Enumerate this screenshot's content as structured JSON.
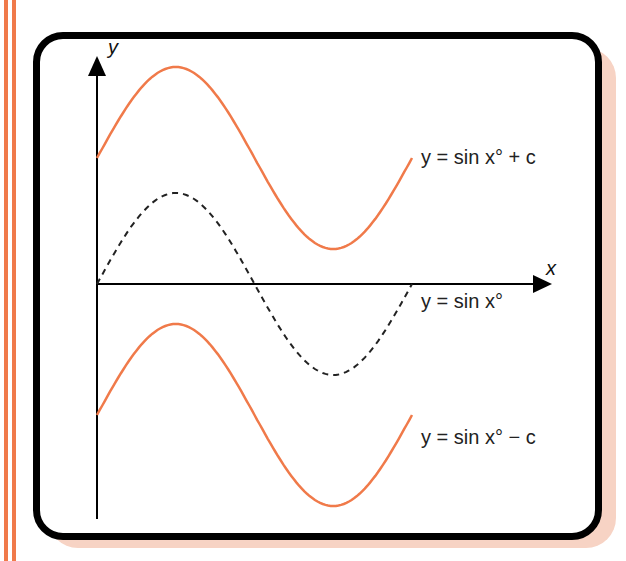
{
  "colors": {
    "accent_orange": "#f07a4a",
    "shadow_pink": "#f7d3c4",
    "border": "#000000",
    "dashed_curve": "#222222"
  },
  "axes": {
    "x_label": "x",
    "y_label": "y"
  },
  "labels": {
    "upper": "y = sin x° + c",
    "middle": "y = sin x°",
    "lower": "y = sin x° − c"
  },
  "chart_data": {
    "type": "line",
    "title": "",
    "xlabel": "x",
    "ylabel": "y",
    "x_range_degrees": [
      0,
      360
    ],
    "grid": false,
    "series": [
      {
        "name": "y = sin x° + c",
        "style": "solid",
        "color": "#f07a4a",
        "offset": "+c",
        "x": [
          0,
          90,
          180,
          270,
          360
        ],
        "y": [
          "c",
          "1+c",
          "c",
          "-1+c",
          "c"
        ]
      },
      {
        "name": "y = sin x°",
        "style": "dashed",
        "color": "#222222",
        "offset": "0",
        "x": [
          0,
          90,
          180,
          270,
          360
        ],
        "y": [
          0,
          1,
          0,
          -1,
          0
        ]
      },
      {
        "name": "y = sin x° − c",
        "style": "solid",
        "color": "#f07a4a",
        "offset": "-c",
        "x": [
          0,
          90,
          180,
          270,
          360
        ],
        "y": [
          "-c",
          "1-c",
          "-c",
          "-1-c",
          "-c"
        ]
      }
    ]
  }
}
